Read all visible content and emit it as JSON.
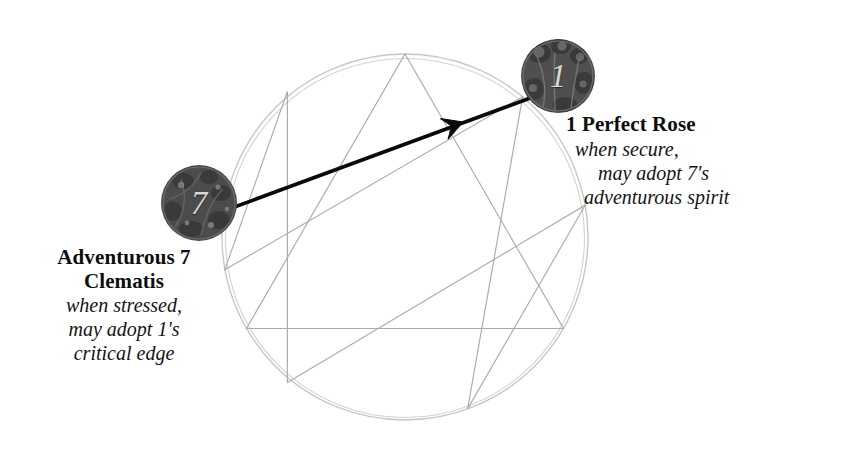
{
  "diagram": {
    "type": "enneagram",
    "circle": {
      "center_x": 405,
      "center_y": 237,
      "radius": 183,
      "stroke_color": "#c9c9c9"
    },
    "inner_lines_color": "#a9a9a9",
    "arrow_color": "#000000",
    "points": [
      {
        "number": "1",
        "angle_deg": -50
      },
      {
        "number": "2",
        "angle_deg": -10
      },
      {
        "number": "3",
        "angle_deg": 30
      },
      {
        "number": "4",
        "angle_deg": 70
      },
      {
        "number": "5",
        "angle_deg": 110
      },
      {
        "number": "6",
        "angle_deg": 150
      },
      {
        "number": "7",
        "angle_deg": 190
      },
      {
        "number": "8",
        "angle_deg": 230
      },
      {
        "number": "9",
        "angle_deg": 270
      }
    ],
    "triangle_path": "9-3-6-9",
    "hexad_path": "1-4-2-8-5-7-1",
    "arrow": {
      "from_point": "7",
      "to_point": "1",
      "from_x": 229,
      "from_y": 209,
      "to_x": 533,
      "to_y": 97,
      "head_position": "mid-line",
      "direction": "7 to 1"
    }
  },
  "badges": {
    "seven": {
      "number": "7",
      "art_name": "clematis-vine-illustration",
      "background_color": "#4a4a4a"
    },
    "one": {
      "number": "1",
      "art_name": "perfect-rose-illustration",
      "background_color": "#4a4a4a"
    }
  },
  "labels": {
    "seven": {
      "title_line_1": "Adventurous 7",
      "title_line_2": "Clematis",
      "sub_line_1": "when stressed,",
      "sub_line_2": "may adopt 1's",
      "sub_line_3": "critical edge"
    },
    "one": {
      "title_line_1": "1 Perfect Rose",
      "sub_line_1": "when secure,",
      "sub_line_2": "may adopt 7's",
      "sub_line_3": "adventurous spirit"
    }
  }
}
